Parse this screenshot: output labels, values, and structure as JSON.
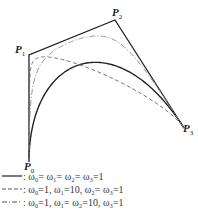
{
  "figure": {
    "type": "rational-cubic-bezier-weights-diagram",
    "control_points": [
      {
        "name": "P",
        "sub": "0",
        "x": 29,
        "y": 162,
        "label_x": 24,
        "label_y": 163
      },
      {
        "name": "P",
        "sub": "1",
        "x": 29,
        "y": 55,
        "label_x": 15,
        "label_y": 46
      },
      {
        "name": "P",
        "sub": "2",
        "x": 115,
        "y": 20,
        "label_x": 112,
        "label_y": 9
      },
      {
        "name": "P",
        "sub": "3",
        "x": 184,
        "y": 128,
        "label_x": 183,
        "label_y": 125
      }
    ],
    "polygon_color": "#222222",
    "curves": [
      {
        "id": "equal-weights",
        "weights": [
          1,
          1,
          1,
          1
        ],
        "style": "solid",
        "color": "#222222",
        "width": 1.4,
        "legend": ": ω₀= ω₁= ω₂= ω₃=1"
      },
      {
        "id": "w1-10",
        "weights": [
          1,
          10,
          1,
          1
        ],
        "style": "dashed",
        "color": "#666666",
        "width": 0.9,
        "legend": ": ω₀=1, ω₁=10, ω₂= ω₃=1"
      },
      {
        "id": "w1-w2-10",
        "weights": [
          1,
          10,
          10,
          1
        ],
        "style": "dashdot",
        "color": "#888888",
        "width": 0.9,
        "legend": ": ω₀=1, ω₁= ω₂=10, ω₃=1"
      }
    ]
  },
  "legend": {
    "rows": [
      {
        "style": "solid",
        "text": ": ω₀= ω₁= ω₂= ω₃=1",
        "y": 170
      },
      {
        "style": "dashed",
        "text": ": ω₀=1, ω₁=10, ω₂= ω₃=1",
        "y": 183
      },
      {
        "style": "dashdot",
        "text": ": ω₀=1, ω₁= ω₂=10, ω₃=1",
        "y": 196
      }
    ]
  }
}
